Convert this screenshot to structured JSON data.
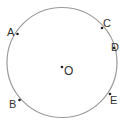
{
  "diagram": {
    "type": "circle-with-points",
    "circle": {
      "cx": 62,
      "cy": 62.5,
      "r": 55,
      "stroke": "#9a9a9a"
    },
    "center": {
      "label": "O",
      "x": 62,
      "y": 67
    },
    "points": [
      {
        "label": "A",
        "x": 17.5,
        "y": 34
      },
      {
        "label": "B",
        "x": 19.5,
        "y": 100
      },
      {
        "label": "C",
        "x": 102,
        "y": 28
      },
      {
        "label": "D",
        "x": 114,
        "y": 48
      },
      {
        "label": "E",
        "x": 110,
        "y": 94
      }
    ]
  }
}
